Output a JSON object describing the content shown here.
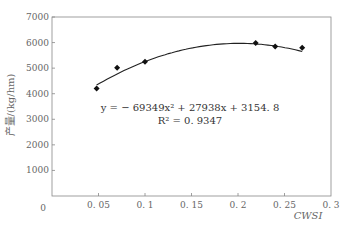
{
  "chart_data": {
    "type": "scatter",
    "title": "",
    "xlabel": "CWSI",
    "ylabel": "产量/(kg/hm)",
    "xlim": [
      0,
      0.3
    ],
    "ylim": [
      0,
      7000
    ],
    "x_ticks": [
      "0",
      "0.05",
      "0.1",
      "0.15",
      "0.2",
      "0.25",
      "0.3"
    ],
    "y_ticks": [
      "0",
      "1000",
      "2000",
      "3000",
      "4000",
      "5000",
      "6000",
      "7000"
    ],
    "grid": false,
    "legend": "none",
    "series": [
      {
        "name": "observed",
        "marker": "diamond",
        "x": [
          0.048,
          0.07,
          0.1,
          0.219,
          0.24,
          0.269
        ],
        "y": [
          4200,
          5020,
          5250,
          5980,
          5850,
          5800
        ]
      },
      {
        "name": "quadratic fit",
        "type": "line",
        "equation": "y = -69349x^2 + 27938x + 3154.8",
        "coefficients": [
          -69349,
          27938,
          3154.8
        ],
        "x_range": [
          0.048,
          0.269
        ]
      }
    ],
    "annotations": {
      "equation": "y = − 69349x² + 27938x + 3154. 8",
      "r_squared": "R² = 0. 9347"
    }
  }
}
